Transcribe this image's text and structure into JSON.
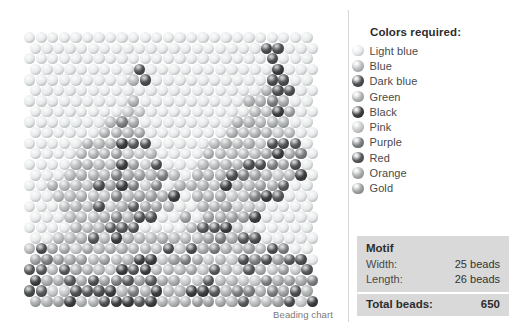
{
  "chart": {
    "caption": "Beading chart"
  },
  "legend": {
    "title": "Colors required:",
    "items": [
      {
        "label": "Light blue",
        "key": "light_blue",
        "color": "#e8ebec"
      },
      {
        "label": "Blue",
        "key": "blue",
        "color": "#b9bcbd"
      },
      {
        "label": "Dark blue",
        "key": "dark_blue",
        "color": "#4b4e50"
      },
      {
        "label": "Green",
        "key": "green",
        "color": "#b0b3b4"
      },
      {
        "label": "Black",
        "key": "black",
        "color": "#3a3c3d"
      },
      {
        "label": "Pink",
        "key": "pink",
        "color": "#c8cacb"
      },
      {
        "label": "Purple",
        "key": "purple",
        "color": "#7b7e80"
      },
      {
        "label": "Red",
        "key": "red",
        "color": "#55585a"
      },
      {
        "label": "Orange",
        "key": "orange",
        "color": "#a8abac"
      },
      {
        "label": "Gold",
        "key": "gold",
        "color": "#9da0a1"
      }
    ]
  },
  "motif": {
    "heading": "Motif",
    "width_label": "Width:",
    "width_value": "25 beads",
    "length_label": "Length:",
    "length_value": "26 beads",
    "total_label": "Total beads:",
    "total_value": "650"
  },
  "chart_data": {
    "type": "heatmap",
    "title": "Beading chart",
    "width_beads": 25,
    "length_beads": 26,
    "total_beads": 650,
    "grid": {
      "bead_diameter_px": 11.4,
      "col_pitch_px": 11.55,
      "row_pitch_px": 10.55,
      "odd_row_offset_px": 5.8,
      "origin_x_px": 24,
      "origin_y_px": 32
    },
    "palette_keys": [
      "light_blue",
      "blue",
      "dark_blue",
      "green",
      "black",
      "pink",
      "purple",
      "red",
      "orange",
      "gold"
    ],
    "legend_position": "right",
    "rows": [
      "0000000000000000000000000",
      "0000000000000000000044000",
      "0000000000000000000004000",
      "000000000400000000000Z000",
      "0000000003400000000004400",
      "0000000000000000000034400",
      "0000000004000000000334400",
      "0000000044000000000334400",
      "0000000344000000003334400",
      "0000003344000000033344400",
      "0000033344400000333344440",
      "0000333444400003333444440",
      "0000333444440003334444440",
      "0003333444444033344444440",
      "0033334444440333444444400",
      "0033334444444033444444000",
      "0003334444444003444440000",
      "0003334444400404444400000",
      "0000333444000044444000000",
      "0033344433333444444400000",
      "4444444444444444444444400",
      "4444444444444444444444440",
      "4444444444444444444444444",
      "4444444444444444444444444",
      "4444444444444444444444444",
      "4444444444444444444444444"
    ]
  }
}
